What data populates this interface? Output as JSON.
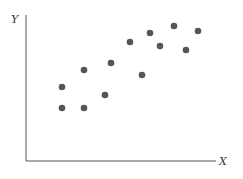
{
  "chart_data": {
    "type": "scatter",
    "title": "",
    "xlabel": "X",
    "ylabel": "Y",
    "grid": false,
    "legend": null,
    "point_color": "#555555",
    "axis_color": "#555555",
    "points": [
      {
        "x": 36,
        "y": 74
      },
      {
        "x": 36,
        "y": 53
      },
      {
        "x": 58,
        "y": 91
      },
      {
        "x": 58,
        "y": 53
      },
      {
        "x": 79,
        "y": 66
      },
      {
        "x": 85,
        "y": 98
      },
      {
        "x": 104,
        "y": 119
      },
      {
        "x": 116,
        "y": 86
      },
      {
        "x": 124,
        "y": 128
      },
      {
        "x": 134,
        "y": 115
      },
      {
        "x": 148,
        "y": 135
      },
      {
        "x": 160,
        "y": 111
      },
      {
        "x": 172,
        "y": 130
      }
    ],
    "xlim": [
      0,
      190
    ],
    "ylim": [
      0,
      146
    ]
  }
}
